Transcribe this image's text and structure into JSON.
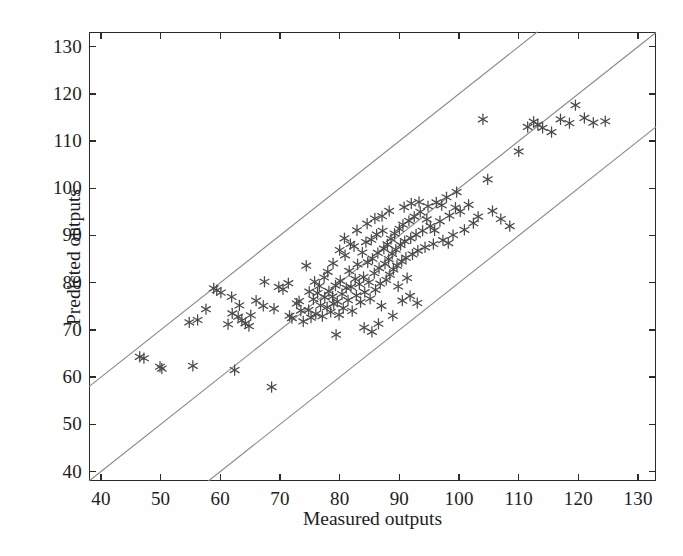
{
  "chart_data": {
    "type": "scatter",
    "title": "",
    "xlabel": "Measured outputs",
    "ylabel": "Predicted outputs",
    "xlim": [
      38.0,
      133.0
    ],
    "ylim": [
      38.0,
      133.1
    ],
    "xticks": [
      40,
      50,
      60,
      70,
      80,
      90,
      100,
      110,
      120,
      130
    ],
    "yticks": [
      40,
      50,
      60,
      70,
      80,
      90,
      100,
      110,
      120,
      130
    ],
    "xticklabels": [
      "40",
      "50",
      "60",
      "70",
      "80",
      "90",
      "100",
      "110",
      "120",
      "130"
    ],
    "yticklabels": [
      "40",
      "50",
      "60",
      "70",
      "80",
      "90",
      "100",
      "110",
      "120",
      "130"
    ],
    "grid": false,
    "legend": null,
    "marker": "asterisk",
    "marker_color": "#4a4a4a",
    "line_color": "#8a8a8a",
    "reference_lines": [
      {
        "name": "identity",
        "slope": 1,
        "intercept": 0,
        "style": "solid"
      },
      {
        "name": "upper-band",
        "slope": 1,
        "intercept": 20,
        "style": "solid"
      },
      {
        "name": "lower-band",
        "slope": 1,
        "intercept": -20,
        "style": "solid"
      }
    ],
    "points": [
      [
        46.5,
        64.3
      ],
      [
        47.2,
        64.0
      ],
      [
        49.9,
        62.2
      ],
      [
        50.2,
        61.8
      ],
      [
        54.8,
        71.6
      ],
      [
        55.4,
        62.4
      ],
      [
        56.2,
        72.1
      ],
      [
        57.6,
        74.4
      ],
      [
        58.9,
        78.8
      ],
      [
        59.4,
        78.4
      ],
      [
        60.1,
        77.9
      ],
      [
        61.3,
        71.2
      ],
      [
        62.0,
        73.5
      ],
      [
        62.4,
        61.5
      ],
      [
        63.0,
        72.8
      ],
      [
        63.6,
        72.0
      ],
      [
        64.2,
        71.4
      ],
      [
        64.8,
        70.8
      ],
      [
        65.1,
        73.1
      ],
      [
        66.0,
        76.2
      ],
      [
        67.2,
        75.1
      ],
      [
        68.6,
        57.9
      ],
      [
        69.0,
        74.5
      ],
      [
        70.5,
        78.6
      ],
      [
        71.4,
        79.9
      ],
      [
        72.0,
        72.5
      ],
      [
        72.8,
        75.6
      ],
      [
        73.2,
        76.1
      ],
      [
        73.9,
        71.8
      ],
      [
        74.4,
        83.6
      ],
      [
        74.8,
        74.2
      ],
      [
        75.2,
        72.6
      ],
      [
        75.6,
        76.5
      ],
      [
        76.0,
        73.4
      ],
      [
        76.3,
        77.8
      ],
      [
        76.8,
        75.2
      ],
      [
        77.1,
        72.9
      ],
      [
        77.5,
        76.9
      ],
      [
        77.9,
        74.8
      ],
      [
        78.2,
        78.2
      ],
      [
        78.5,
        73.8
      ],
      [
        78.8,
        77.1
      ],
      [
        79.0,
        75.5
      ],
      [
        79.3,
        79.4
      ],
      [
        79.6,
        76.0
      ],
      [
        79.9,
        73.2
      ],
      [
        80.1,
        80.4
      ],
      [
        80.4,
        77.6
      ],
      [
        80.6,
        74.6
      ],
      [
        80.9,
        85.8
      ],
      [
        81.1,
        78.9
      ],
      [
        81.4,
        76.3
      ],
      [
        81.6,
        82.5
      ],
      [
        81.9,
        79.1
      ],
      [
        82.1,
        74.0
      ],
      [
        82.4,
        87.7
      ],
      [
        82.6,
        80.8
      ],
      [
        82.8,
        77.3
      ],
      [
        83.0,
        83.9
      ],
      [
        83.3,
        79.7
      ],
      [
        83.5,
        75.9
      ],
      [
        83.8,
        86.4
      ],
      [
        84.0,
        81.2
      ],
      [
        84.2,
        78.0
      ],
      [
        84.4,
        88.6
      ],
      [
        84.7,
        84.3
      ],
      [
        84.9,
        80.1
      ],
      [
        85.1,
        76.6
      ],
      [
        85.3,
        89.1
      ],
      [
        85.5,
        85.1
      ],
      [
        85.8,
        82.0
      ],
      [
        86.0,
        78.5
      ],
      [
        86.2,
        90.2
      ],
      [
        86.4,
        86.3
      ],
      [
        86.6,
        83.1
      ],
      [
        86.8,
        79.8
      ],
      [
        87.0,
        75.1
      ],
      [
        87.2,
        91.0
      ],
      [
        87.4,
        87.2
      ],
      [
        87.6,
        84.0
      ],
      [
        87.8,
        80.6
      ],
      [
        88.0,
        88.1
      ],
      [
        88.2,
        85.0
      ],
      [
        88.4,
        81.7
      ],
      [
        88.6,
        89.3
      ],
      [
        88.8,
        86.1
      ],
      [
        89.0,
        82.8
      ],
      [
        89.2,
        90.4
      ],
      [
        89.4,
        87.0
      ],
      [
        89.6,
        83.6
      ],
      [
        89.8,
        79.2
      ],
      [
        90.0,
        91.4
      ],
      [
        90.2,
        88.0
      ],
      [
        90.4,
        84.5
      ],
      [
        90.6,
        92.3
      ],
      [
        90.9,
        88.8
      ],
      [
        91.1,
        85.3
      ],
      [
        91.3,
        81.0
      ],
      [
        91.6,
        93.1
      ],
      [
        91.9,
        89.4
      ],
      [
        92.2,
        86.0
      ],
      [
        92.5,
        94.0
      ],
      [
        92.8,
        90.2
      ],
      [
        93.1,
        86.8
      ],
      [
        93.5,
        95.0
      ],
      [
        93.9,
        91.0
      ],
      [
        94.3,
        87.5
      ],
      [
        94.8,
        96.2
      ],
      [
        95.2,
        92.0
      ],
      [
        95.7,
        88.2
      ],
      [
        96.2,
        97.0
      ],
      [
        96.8,
        93.0
      ],
      [
        97.3,
        89.0
      ],
      [
        97.9,
        98.1
      ],
      [
        98.4,
        94.2
      ],
      [
        99.0,
        90.1
      ],
      [
        99.6,
        99.2
      ],
      [
        100.2,
        95.1
      ],
      [
        100.9,
        91.2
      ],
      [
        101.6,
        96.5
      ],
      [
        102.4,
        92.6
      ],
      [
        103.2,
        94.0
      ],
      [
        104.0,
        114.6
      ],
      [
        104.8,
        101.9
      ],
      [
        105.6,
        95.2
      ],
      [
        107.0,
        93.5
      ],
      [
        108.5,
        92.0
      ],
      [
        110.0,
        107.8
      ],
      [
        111.5,
        113.0
      ],
      [
        112.5,
        114.1
      ],
      [
        113.2,
        113.5
      ],
      [
        114.0,
        112.8
      ],
      [
        115.5,
        111.9
      ],
      [
        117.0,
        114.6
      ],
      [
        118.5,
        113.8
      ],
      [
        119.5,
        117.6
      ],
      [
        121.0,
        114.9
      ],
      [
        122.5,
        113.9
      ],
      [
        124.5,
        114.2
      ],
      [
        71.6,
        73.0
      ],
      [
        73.5,
        74.1
      ],
      [
        74.9,
        78.1
      ],
      [
        75.8,
        80.2
      ],
      [
        76.6,
        79.3
      ],
      [
        77.4,
        81.1
      ],
      [
        78.0,
        82.3
      ],
      [
        78.9,
        84.1
      ],
      [
        80.0,
        86.9
      ],
      [
        80.8,
        89.4
      ],
      [
        81.8,
        88.2
      ],
      [
        82.9,
        91.1
      ],
      [
        84.6,
        92.5
      ],
      [
        85.9,
        93.6
      ],
      [
        87.1,
        94.1
      ],
      [
        88.3,
        95.2
      ],
      [
        90.8,
        96.0
      ],
      [
        92.0,
        96.8
      ],
      [
        93.3,
        97.1
      ],
      [
        94.6,
        93.4
      ],
      [
        95.9,
        91.1
      ],
      [
        97.1,
        96.4
      ],
      [
        98.2,
        88.4
      ],
      [
        99.4,
        95.9
      ],
      [
        67.4,
        80.2
      ],
      [
        69.8,
        79.1
      ],
      [
        63.2,
        75.2
      ],
      [
        61.9,
        77.0
      ],
      [
        84.1,
        70.5
      ],
      [
        85.4,
        69.6
      ],
      [
        90.5,
        76.2
      ],
      [
        93.0,
        75.7
      ],
      [
        79.4,
        69.0
      ],
      [
        86.5,
        71.3
      ],
      [
        88.9,
        73.0
      ],
      [
        91.8,
        77.2
      ]
    ]
  },
  "axis": {
    "xlabel": "Measured outputs",
    "ylabel": "Predicted outputs"
  }
}
